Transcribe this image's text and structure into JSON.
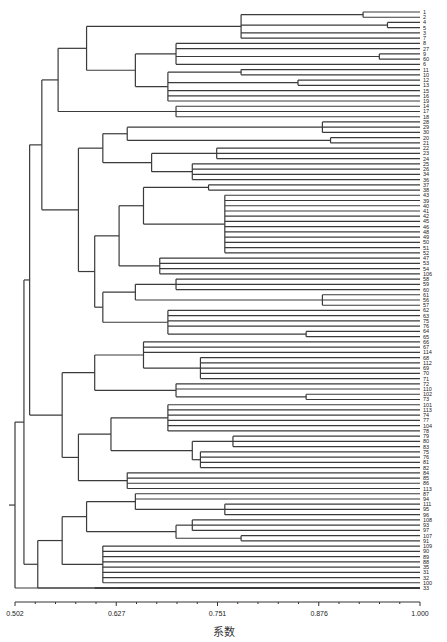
{
  "chart_data": {
    "type": "dendrogram",
    "title": "",
    "xlabel": "系数",
    "ylabel": "",
    "xlim": [
      0.502,
      1.0
    ],
    "x_ticks": [
      0.502,
      0.627,
      0.751,
      0.876,
      1.0
    ],
    "x_tick_labels": [
      "0.502",
      "0.627",
      "0.751",
      "0.876",
      "1.000"
    ],
    "orientation": "left-to-right, leaves on right",
    "line_color": "#3a3a3a",
    "leaves": [
      "1",
      "2",
      "4",
      "5",
      "3",
      "7",
      "8",
      "27",
      "9",
      "60",
      "6",
      "11",
      "10",
      "12",
      "13",
      "15",
      "16",
      "19",
      "14",
      "17",
      "18",
      "28",
      "29",
      "30",
      "20",
      "21",
      "22",
      "23",
      "24",
      "25",
      "26",
      "34",
      "36",
      "37",
      "38",
      "43",
      "39",
      "40",
      "41",
      "42",
      "45",
      "46",
      "48",
      "49",
      "50",
      "51",
      "52",
      "47",
      "53",
      "54",
      "106",
      "58",
      "59",
      "60",
      "61",
      "56",
      "57",
      "62",
      "63",
      "75",
      "76",
      "64",
      "65",
      "66",
      "67",
      "114",
      "68",
      "112",
      "69",
      "70",
      "71",
      "72",
      "110",
      "102",
      "73",
      "101",
      "113",
      "74",
      "77",
      "104",
      "78",
      "79",
      "80",
      "83",
      "75",
      "76",
      "81",
      "82",
      "84",
      "85",
      "86",
      "113",
      "87",
      "94",
      "111",
      "95",
      "96",
      "108",
      "93",
      "97",
      "107",
      "91",
      "109",
      "90",
      "89",
      "88",
      "35",
      "31",
      "32",
      "100",
      "33"
    ],
    "tree": {
      "h": 0.502,
      "c": [
        {
          "h": 0.513,
          "c": [
            {
              "h": 0.52,
              "c": [
                {
                  "h": 0.535,
                  "c": [
                    {
                      "h": 0.555,
                      "c": [
                        {
                          "h": 0.59,
                          "c": [
                            {
                              "h": 0.78,
                              "c": [
                                {
                                  "h": 0.93,
                                  "c": [
                                    0,
                                    1
                                  ]
                                },
                                {
                                  "h": 0.96,
                                  "c": [
                                    2,
                                    3
                                  ]
                                },
                                4,
                                5
                              ]
                            },
                            {
                              "h": 0.65,
                              "c": [
                                {
                                  "h": 0.7,
                                  "c": [
                                    6,
                                    7,
                                    {
                                      "h": 0.95,
                                      "c": [
                                        8,
                                        9
                                      ]
                                    },
                                    10
                                  ]
                                },
                                {
                                  "h": 0.69,
                                  "c": [
                                    {
                                      "h": 0.78,
                                      "c": [
                                        11,
                                        12
                                      ]
                                    },
                                    {
                                      "h": 0.85,
                                      "c": [
                                        13,
                                        14
                                      ]
                                    },
                                    15,
                                    16,
                                    17
                                  ]
                                }
                              ]
                            }
                          ]
                        },
                        {
                          "h": 0.7,
                          "c": [
                            18,
                            19,
                            20
                          ]
                        }
                      ]
                    },
                    {
                      "h": 0.58,
                      "c": [
                        {
                          "h": 0.61,
                          "c": [
                            {
                              "h": 0.64,
                              "c": [
                                {
                                  "h": 0.88,
                                  "c": [
                                    21,
                                    22,
                                    23
                                  ]
                                },
                                {
                                  "h": 0.89,
                                  "c": [
                                    24,
                                    25
                                  ]
                                }
                              ]
                            },
                            {
                              "h": 0.67,
                              "c": [
                                {
                                  "h": 0.75,
                                  "c": [
                                    26,
                                    27,
                                    28
                                  ]
                                },
                                {
                                  "h": 0.72,
                                  "c": [
                                    29,
                                    30,
                                    31,
                                    32
                                  ]
                                }
                              ]
                            }
                          ]
                        },
                        {
                          "h": 0.6,
                          "c": [
                            {
                              "h": 0.63,
                              "c": [
                                {
                                  "h": 0.66,
                                  "c": [
                                    {
                                      "h": 0.74,
                                      "c": [
                                        33,
                                        34
                                      ]
                                    },
                                    {
                                      "h": 0.76,
                                      "c": [
                                        35,
                                        36,
                                        37,
                                        38,
                                        39,
                                        40,
                                        41,
                                        42,
                                        43,
                                        44,
                                        45,
                                        46
                                      ]
                                    }
                                  ]
                                },
                                {
                                  "h": 0.68,
                                  "c": [
                                    47,
                                    48,
                                    49,
                                    50
                                  ]
                                }
                              ]
                            },
                            {
                              "h": 0.61,
                              "c": [
                                {
                                  "h": 0.65,
                                  "c": [
                                    {
                                      "h": 0.7,
                                      "c": [
                                        51,
                                        52,
                                        53
                                      ]
                                    },
                                    {
                                      "h": 0.88,
                                      "c": [
                                        54,
                                        55,
                                        56
                                      ]
                                    }
                                  ]
                                },
                                {
                                  "h": 0.69,
                                  "c": [
                                    57,
                                    58,
                                    59,
                                    60,
                                    {
                                      "h": 0.86,
                                      "c": [
                                        61,
                                        62
                                      ]
                                    }
                                  ]
                                }
                              ]
                            }
                          ]
                        }
                      ]
                    }
                  ]
                },
                {
                  "h": 0.56,
                  "c": [
                    {
                      "h": 0.6,
                      "c": [
                        {
                          "h": 0.66,
                          "c": [
                            63,
                            64,
                            65,
                            {
                              "h": 0.73,
                              "c": [
                                66,
                                67,
                                68,
                                69,
                                70
                              ]
                            }
                          ]
                        },
                        {
                          "h": 0.7,
                          "c": [
                            71,
                            72,
                            {
                              "h": 0.86,
                              "c": [
                                73,
                                74
                              ]
                            }
                          ]
                        }
                      ]
                    },
                    {
                      "h": 0.58,
                      "c": [
                        {
                          "h": 0.62,
                          "c": [
                            {
                              "h": 0.69,
                              "c": [
                                75,
                                76,
                                77,
                                78,
                                79,
                                80
                              ]
                            },
                            {
                              "h": 0.72,
                              "c": [
                                {
                                  "h": 0.77,
                                  "c": [
                                    81,
                                    82,
                                    83
                                  ]
                                },
                                {
                                  "h": 0.73,
                                  "c": [
                                    84,
                                    85,
                                    86,
                                    87
                                  ]
                                }
                              ]
                            }
                          ]
                        },
                        {
                          "h": 0.64,
                          "c": [
                            88,
                            89,
                            90,
                            91
                          ]
                        }
                      ]
                    }
                  ]
                }
              ]
            },
            {
              "h": 0.53,
              "c": [
                {
                  "h": 0.56,
                  "c": [
                    {
                      "h": 0.59,
                      "c": [
                        {
                          "h": 0.65,
                          "c": [
                            92,
                            93,
                            {
                              "h": 0.76,
                              "c": [
                                94,
                                95,
                                96
                              ]
                            }
                          ]
                        },
                        {
                          "h": 0.7,
                          "c": [
                            {
                              "h": 0.72,
                              "c": [
                                97,
                                98,
                                99
                              ]
                            },
                            {
                              "h": 0.78,
                              "c": [
                                100,
                                101
                              ]
                            }
                          ]
                        }
                      ]
                    },
                    {
                      "h": 0.61,
                      "c": [
                        102,
                        103,
                        104,
                        105,
                        106,
                        107,
                        108,
                        109
                      ]
                    }
                  ]
                },
                {
                  "h": 0.6,
                  "c": [
                    110,
                    111,
                    {
                      "h": 0.63,
                      "c": [
                        112,
                        113,
                        114
                      ]
                    }
                  ]
                }
              ]
            }
          ]
        },
        {
          "h": 0.65,
          "c": [
            {
              "h": 0.78,
              "c": [
                115,
                116
              ]
            },
            {
              "h": 0.85,
              "c": [
                117,
                118
              ]
            }
          ]
        }
      ]
    }
  },
  "axis": {
    "label": "系数"
  }
}
